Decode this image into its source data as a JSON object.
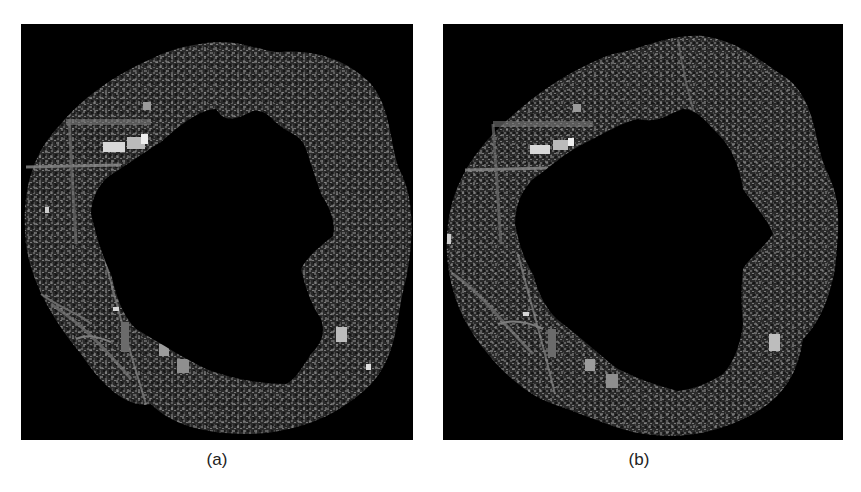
{
  "figure": {
    "background_color": "#ffffff",
    "image_background_color": "#000000",
    "panels": [
      {
        "label": "(a)",
        "description": "Aerial image ring with masked (black) irregular center region",
        "mask_shape": "irregular, larger bulge toward lower-right"
      },
      {
        "label": "(b)",
        "description": "Aerial image ring with masked (black) irregular center region",
        "mask_shape": "irregular, rounder star-like shape"
      }
    ]
  }
}
